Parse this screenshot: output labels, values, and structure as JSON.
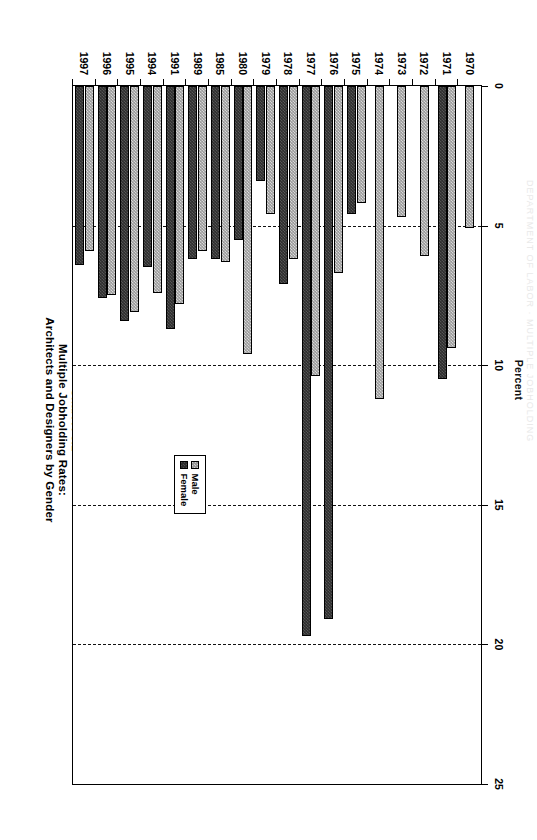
{
  "page": {
    "faint_header": "DEPARTMENT OF LABOR  ·  MULTIPLE JOBHOLDING"
  },
  "title": {
    "line1": "Chart A-3.1",
    "line2": "Multiple Jobholding Rates:",
    "line3": "Architects and Designers by Gender"
  },
  "legend": {
    "position": "inside-right-middle",
    "entries": [
      {
        "label": "Male",
        "color": "#9a9a9a"
      },
      {
        "label": "Female",
        "color": "#2e2e2e"
      }
    ]
  },
  "chart_data": {
    "type": "bar",
    "orientation": "horizontal",
    "title": "Chart A-3.1 Multiple Jobholding Rates: Architects and Designers by Gender",
    "xlabel": "Percent",
    "ylabel": "",
    "xlim": [
      0,
      25
    ],
    "xticks": [
      0,
      5,
      10,
      15,
      20,
      25
    ],
    "xtick_labels": [
      "0",
      "5",
      "10",
      "15",
      "20",
      "25"
    ],
    "grid": "vertical-dashed",
    "categories": [
      "1970",
      "1971",
      "1972",
      "1973",
      "1974",
      "1975",
      "1976",
      "1977",
      "1978",
      "1979",
      "1980",
      "1985",
      "1989",
      "1991",
      "1994",
      "1995",
      "1996",
      "1997"
    ],
    "series": [
      {
        "name": "Male",
        "color": "#9a9a9a",
        "values": [
          5.1,
          9.4,
          6.1,
          4.7,
          11.2,
          4.2,
          6.7,
          10.4,
          6.2,
          4.6,
          9.6,
          6.3,
          5.9,
          7.8,
          7.4,
          8.1,
          7.5,
          5.9
        ]
      },
      {
        "name": "Female",
        "color": "#2e2e2e",
        "values": [
          null,
          10.5,
          null,
          null,
          null,
          4.6,
          19.1,
          19.7,
          7.1,
          3.4,
          5.5,
          6.2,
          6.2,
          8.7,
          6.5,
          8.4,
          7.6,
          6.4
        ]
      }
    ]
  }
}
